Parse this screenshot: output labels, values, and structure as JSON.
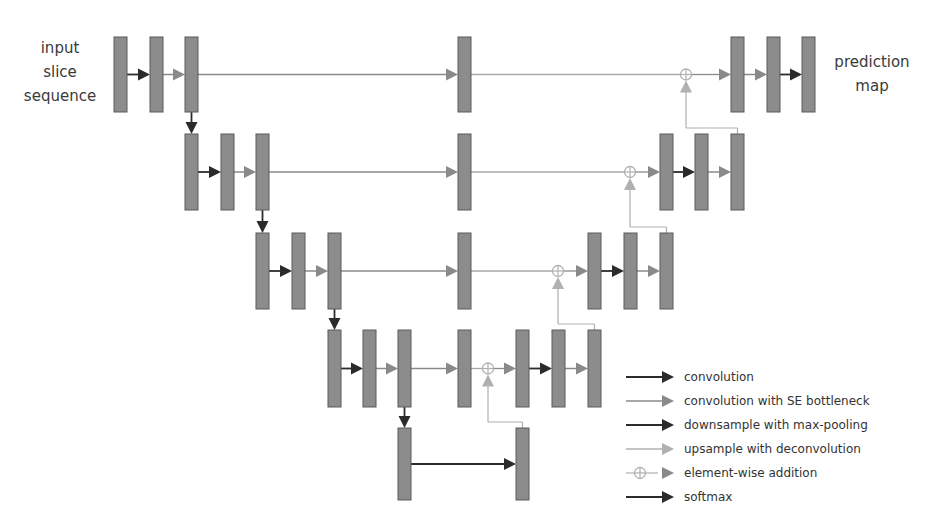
{
  "labels": {
    "input": [
      "input",
      "slice",
      "sequence"
    ],
    "output": [
      "prediction",
      "map"
    ]
  },
  "colors": {
    "block_fill": "#8c8c8c",
    "block_stroke": "#5a5a5a",
    "convolution": "#2b2b2b",
    "se_convolution": "#8a8a8a",
    "downsample": "#2b2b2b",
    "upsample": "#b0b0b0",
    "skip_line": "#a8a8a8",
    "softmax": "#2b2b2b"
  },
  "legend": [
    {
      "type": "convolution",
      "label": "convolution"
    },
    {
      "type": "se_convolution",
      "label": "convolution with SE bottleneck"
    },
    {
      "type": "downsample",
      "label": "downsample with max-pooling"
    },
    {
      "type": "upsample",
      "label": "upsample with deconvolution"
    },
    {
      "type": "addition",
      "label": "element-wise addition"
    },
    {
      "type": "softmax",
      "label": "softmax"
    }
  ],
  "levels": [
    {
      "name": "level-0",
      "encoder_x": [
        114,
        150,
        185
      ],
      "middle_x": 458,
      "decoder_x": [
        731,
        767,
        802
      ],
      "y": 37,
      "h": 75,
      "add_x": 686
    },
    {
      "name": "level-1",
      "encoder_x": [
        185,
        221,
        256
      ],
      "middle_x": 458,
      "decoder_x": [
        660,
        695,
        731
      ],
      "y": 134,
      "h": 76,
      "add_x": 630
    },
    {
      "name": "level-2",
      "encoder_x": [
        256,
        292,
        328
      ],
      "middle_x": 458,
      "decoder_x": [
        588,
        624,
        660
      ],
      "y": 233,
      "h": 76,
      "add_x": 558
    },
    {
      "name": "level-3",
      "encoder_x": [
        328,
        363,
        398
      ],
      "middle_x": 458,
      "decoder_x": [
        516,
        552,
        588
      ],
      "y": 330,
      "h": 77,
      "add_x": 488
    },
    {
      "name": "level-4",
      "encoder_x": [
        398
      ],
      "middle_x": null,
      "decoder_x": [
        516
      ],
      "y": 428,
      "h": 72,
      "add_x": null
    }
  ]
}
